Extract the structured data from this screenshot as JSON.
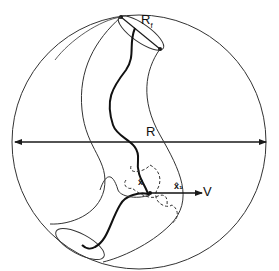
{
  "diagram": {
    "labels": {
      "R": "R",
      "Rf": "R",
      "Rf_sub": "f",
      "V": "V",
      "small_left": "x̂",
      "small_right": "x̂₁"
    },
    "colors": {
      "stroke": "#1a1a1a",
      "background": "#ffffff"
    }
  }
}
